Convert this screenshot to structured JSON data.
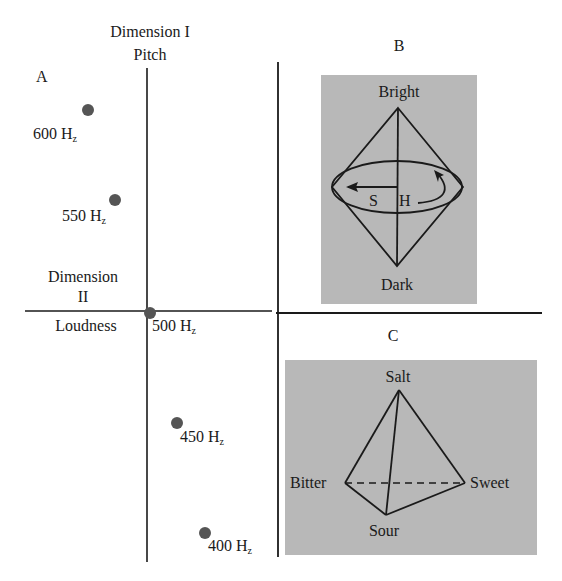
{
  "panel_a": {
    "letter": "A",
    "dim1_title": "Dimension I",
    "dim1_label": "Pitch",
    "dim2_title": "Dimension",
    "dim2_number": "II",
    "dim2_label": "Loudness",
    "points": [
      {
        "freq": "600",
        "unit_H": "H",
        "unit_z": "z",
        "x": 88,
        "y": 110
      },
      {
        "freq": "550",
        "unit_H": "H",
        "unit_z": "z",
        "x": 115,
        "y": 200
      },
      {
        "freq": "500",
        "unit_H": "H",
        "unit_z": "z",
        "x": 150,
        "y": 313
      },
      {
        "freq": "450",
        "unit_H": "H",
        "unit_z": "z",
        "x": 177,
        "y": 423
      },
      {
        "freq": "400",
        "unit_H": "H",
        "unit_z": "z",
        "x": 205,
        "y": 533
      }
    ]
  },
  "panel_b": {
    "letter": "B",
    "top_label": "Bright",
    "bottom_label": "Dark",
    "saturation_label": "S",
    "hue_label": "H"
  },
  "panel_c": {
    "letter": "C",
    "top_label": "Salt",
    "left_label": "Bitter",
    "right_label": "Sweet",
    "bottom_label": "Sour"
  },
  "colors": {
    "ink": "#1a1a1a",
    "panel_gray": "#b8b8b8",
    "point": "#555555"
  }
}
